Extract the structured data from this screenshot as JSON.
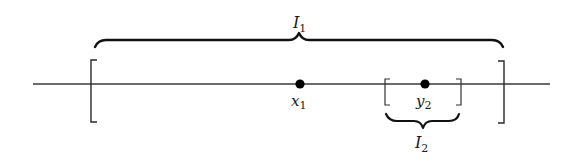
{
  "diagram": {
    "type": "number-line-intervals",
    "colors": {
      "stroke": "#2a2a2a",
      "point": "#000000",
      "background": "#ffffff"
    },
    "axis": {
      "x_start": 33,
      "x_end": 550,
      "y": 84
    },
    "intervals": [
      {
        "name": "I1",
        "label_main": "I",
        "label_sub": "1",
        "left_x": 91,
        "right_x": 504,
        "brace_position": "above"
      },
      {
        "name": "I2",
        "label_main": "I",
        "label_sub": "2",
        "left_x": 385,
        "right_x": 461,
        "brace_position": "below"
      }
    ],
    "points": [
      {
        "name": "x1",
        "label_main": "x",
        "label_sub": "1",
        "x": 300
      },
      {
        "name": "y2",
        "label_main": "y",
        "label_sub": "2",
        "x": 425
      }
    ]
  }
}
